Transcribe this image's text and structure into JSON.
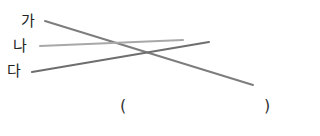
{
  "labels": [
    {
      "text": "가",
      "x": 21,
      "y": 13
    },
    {
      "text": "나",
      "x": 13,
      "y": 38
    },
    {
      "text": "다",
      "x": 7,
      "y": 63
    }
  ],
  "lines": [
    {
      "from": "가",
      "x1": 45,
      "y1": 21,
      "x2": 253,
      "y2": 85,
      "color": "#7d7d7d",
      "width": 2
    },
    {
      "from": "나",
      "x1": 40,
      "y1": 46,
      "x2": 183,
      "y2": 40,
      "color": "#a8a8a8",
      "width": 2
    },
    {
      "from": "다",
      "x1": 32,
      "y1": 72,
      "x2": 209,
      "y2": 42,
      "color": "#6e6e6e",
      "width": 2
    }
  ],
  "answer": {
    "open": "(",
    "close": ")",
    "value": ""
  }
}
